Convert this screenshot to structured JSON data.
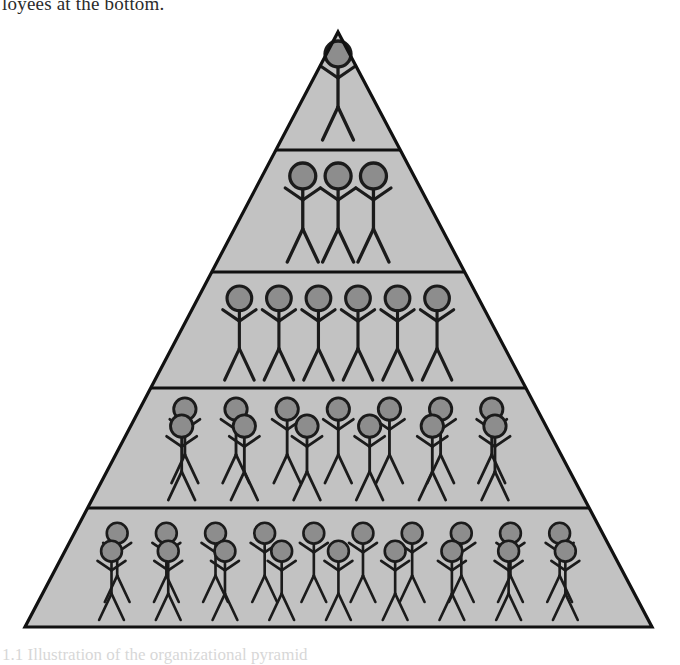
{
  "page": {
    "background_color": "#ffffff",
    "width": 680,
    "height": 659
  },
  "caption_top": {
    "text": "loyees at the bottom.",
    "note_visible_fragment": true
  },
  "caption_bottom": {
    "text": "1.1 Illustration of the organizational pyramid"
  },
  "diagram": {
    "name": "organizational-hierarchy-pyramid",
    "title": "Organizational Pyramid",
    "colors": {
      "pyramid_fill": "#c2c2c2",
      "pyramid_stroke": "#111111",
      "divider_stroke": "#111111",
      "head_fill": "#8d8d8d",
      "figure_stroke": "#1b1b1b",
      "page_background": "#ffffff"
    },
    "geometry": {
      "apex_x": 338,
      "apex_y": 32,
      "base_left_x": 25,
      "base_right_x": 652,
      "base_y": 627,
      "divider_y": [
        150,
        272,
        388,
        508
      ],
      "stroke_width": 3.2
    },
    "tiers": [
      {
        "index": 1,
        "label": "tier-1",
        "figure_count": 1,
        "rows": [
          {
            "row": "single",
            "count": 1,
            "baseline_y": 140,
            "scale": 1.0
          }
        ]
      },
      {
        "index": 2,
        "label": "tier-2",
        "figure_count": 3,
        "rows": [
          {
            "row": "single",
            "count": 3,
            "baseline_y": 262,
            "scale": 1.0
          }
        ]
      },
      {
        "index": 3,
        "label": "tier-3",
        "figure_count": 6,
        "rows": [
          {
            "row": "single",
            "count": 6,
            "baseline_y": 380,
            "scale": 0.95
          }
        ]
      },
      {
        "index": 4,
        "label": "tier-4",
        "figure_count": 13,
        "rows": [
          {
            "row": "back",
            "count": 7,
            "baseline_y": 483,
            "scale": 0.86
          },
          {
            "row": "front",
            "count": 6,
            "baseline_y": 500,
            "scale": 0.86
          }
        ]
      },
      {
        "index": 5,
        "label": "tier-5",
        "figure_count": 19,
        "rows": [
          {
            "row": "back",
            "count": 10,
            "baseline_y": 602,
            "scale": 0.8
          },
          {
            "row": "front",
            "count": 9,
            "baseline_y": 620,
            "scale": 0.8
          }
        ]
      }
    ],
    "total_figures": 42
  }
}
